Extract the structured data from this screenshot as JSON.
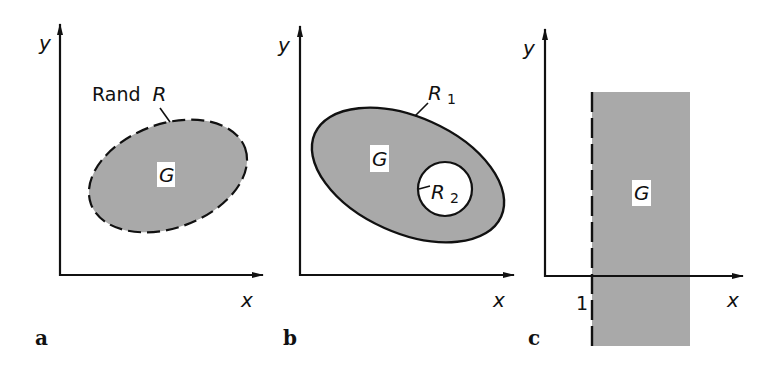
{
  "colors": {
    "fill_region": "#a9a9a9",
    "stroke": "#111111",
    "background": "#ffffff",
    "label_box": "#ffffff"
  },
  "panels": [
    {
      "letter": "a",
      "axis_x_label": "x",
      "axis_y_label": "y",
      "region_label": "G",
      "boundary_label_prefix": "Rand",
      "boundary_label": "R",
      "boundary_style": "dashed"
    },
    {
      "letter": "b",
      "axis_x_label": "x",
      "axis_y_label": "y",
      "region_label": "G",
      "outer_boundary_label": "R",
      "outer_boundary_sub": "1",
      "inner_boundary_label": "R",
      "inner_boundary_sub": "2",
      "boundary_style": "solid"
    },
    {
      "letter": "c",
      "axis_x_label": "x",
      "axis_y_label": "y",
      "region_label": "G",
      "tick_label": "1",
      "boundary_style": "dashed"
    }
  ]
}
